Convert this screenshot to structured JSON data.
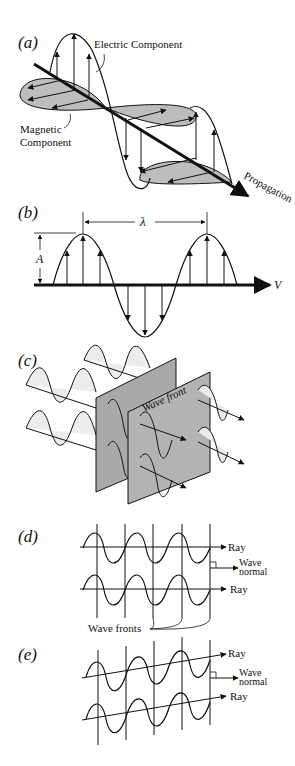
{
  "panels": {
    "a": {
      "label": "(a)",
      "electric": "Electric Component",
      "magnetic_1": "Magnetic",
      "magnetic_2": "Component",
      "propagation": "Propagation"
    },
    "b": {
      "label": "(b)",
      "wavelength": "λ",
      "amplitude": "A",
      "velocity": "V"
    },
    "c": {
      "label": "(c)",
      "wave_front": "Wave front"
    },
    "d": {
      "label": "(d)",
      "ray_top": "Ray",
      "wave_1": "Wave",
      "normal_1": "normal",
      "ray_bottom": "Ray",
      "wave_fronts": "Wave fronts"
    },
    "e": {
      "label": "(e)",
      "ray_top": "Ray",
      "wave_1": "Wave",
      "normal_1": "normal",
      "ray_bottom": "Ray"
    }
  },
  "colors": {
    "ink": "#111111",
    "shade": "#bdbdbd",
    "plane": "#a9a9a9"
  }
}
